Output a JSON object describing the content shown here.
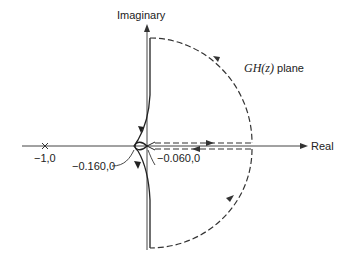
{
  "diagram": {
    "type": "nyquist-plot",
    "plane_label_fn": "GH(z)",
    "plane_label_suffix": " plane",
    "axes": {
      "imaginary_label": "Imaginary",
      "real_label": "Real"
    },
    "points": [
      {
        "label": "−1,0",
        "re": -1.0,
        "im": 0
      },
      {
        "label": "−0.160,0",
        "re": -0.16,
        "im": 0
      },
      {
        "label": "−0.060,0",
        "re": -0.06,
        "im": 0
      }
    ],
    "colors": {
      "line": "#333333",
      "text": "#222222",
      "background": "#ffffff"
    }
  }
}
